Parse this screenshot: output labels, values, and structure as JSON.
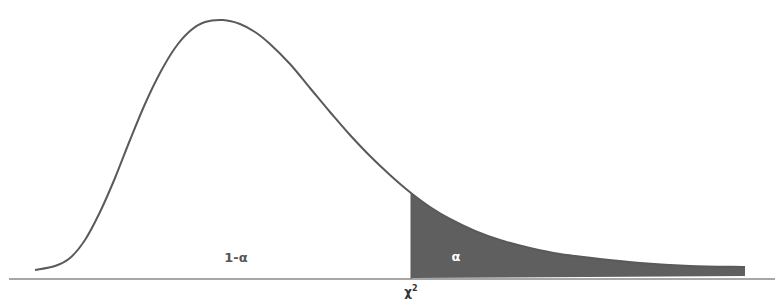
{
  "chart_data": {
    "type": "area",
    "title": "",
    "xlabel": "",
    "ylabel": "",
    "grid": false,
    "legend": null,
    "regions": [
      {
        "name": "acceptance",
        "label": "1-α",
        "shaded": false
      },
      {
        "name": "rejection",
        "label": "α",
        "shaded": true,
        "color": "#5f5f5f"
      }
    ],
    "critical_value_label": "χ",
    "critical_value_sup": "2",
    "curve_points_px": [
      [
        35,
        270
      ],
      [
        55,
        266
      ],
      [
        70,
        258
      ],
      [
        85,
        240
      ],
      [
        100,
        212
      ],
      [
        115,
        178
      ],
      [
        130,
        140
      ],
      [
        145,
        104
      ],
      [
        160,
        73
      ],
      [
        175,
        48
      ],
      [
        190,
        31
      ],
      [
        205,
        22
      ],
      [
        223,
        20
      ],
      [
        240,
        24
      ],
      [
        255,
        32
      ],
      [
        270,
        44
      ],
      [
        290,
        64
      ],
      [
        310,
        88
      ],
      [
        330,
        112
      ],
      [
        350,
        135
      ],
      [
        370,
        156
      ],
      [
        390,
        175
      ],
      [
        411,
        193
      ],
      [
        430,
        207
      ],
      [
        450,
        219
      ],
      [
        475,
        231
      ],
      [
        500,
        240
      ],
      [
        530,
        248
      ],
      [
        560,
        254
      ],
      [
        600,
        259
      ],
      [
        640,
        263
      ],
      [
        690,
        266
      ],
      [
        745,
        267
      ]
    ],
    "colors": {
      "curve": "#5a5a5a",
      "fill": "#5f5f5f",
      "axis": "#8a8a8a"
    }
  },
  "labels": {
    "acceptance": "1-α",
    "rejection": "α",
    "critical_base": "χ",
    "critical_sup": "2"
  }
}
